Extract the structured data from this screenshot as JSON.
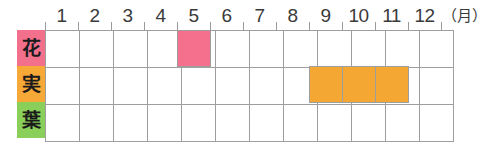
{
  "header": {
    "unit": "（月）",
    "months": [
      "1",
      "2",
      "3",
      "4",
      "5",
      "6",
      "7",
      "8",
      "9",
      "10",
      "11",
      "12"
    ]
  },
  "rows": [
    {
      "label": "花",
      "label_color": "#F2708C",
      "name": "flower"
    },
    {
      "label": "実",
      "label_color": "#F7A937",
      "name": "fruit"
    },
    {
      "label": "葉",
      "label_color": "#8ACF5A",
      "name": "leaf"
    }
  ],
  "colors": {
    "flower_fill": "#F4708C",
    "fruit_fill": "#F5A734",
    "leaf_fill": "#8ACF5A",
    "grid_line": "#9e9e9e",
    "tick": "#9a9a9a",
    "text": "#3a3a3a"
  },
  "chart_data": {
    "type": "heatmap",
    "title": "",
    "xlabel": "（月）",
    "ylabel": "",
    "categories": [
      "1",
      "2",
      "3",
      "4",
      "5",
      "6",
      "7",
      "8",
      "9",
      "10",
      "11",
      "12"
    ],
    "rows": [
      "花",
      "実",
      "葉"
    ],
    "grid": true,
    "legend": "none",
    "series": [
      {
        "name": "花",
        "color": "#F4708C",
        "values": [
          0,
          0,
          0,
          0,
          1,
          0,
          0,
          0,
          0,
          0,
          0,
          0
        ]
      },
      {
        "name": "実",
        "color": "#F5A734",
        "values": [
          0,
          0,
          0,
          0,
          0,
          0,
          0,
          0,
          1,
          1,
          1,
          0
        ]
      },
      {
        "name": "葉",
        "color": "#8ACF5A",
        "values": [
          0,
          0,
          0,
          0,
          0,
          0,
          0,
          0,
          0,
          0,
          0,
          0
        ]
      }
    ],
    "spans": [
      {
        "row": "花",
        "start_month": 5,
        "end_month": 5,
        "color": "#F4708C"
      },
      {
        "row": "実",
        "start_month": 9,
        "end_month": 11,
        "color": "#F5A734"
      }
    ]
  }
}
